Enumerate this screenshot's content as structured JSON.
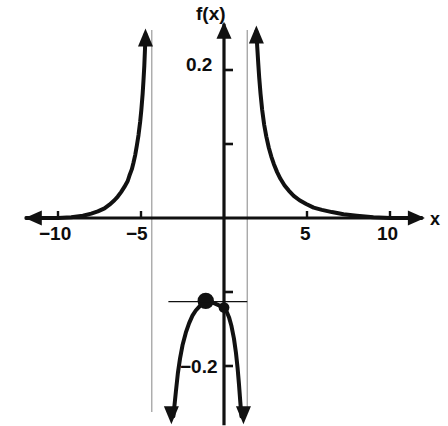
{
  "figure": {
    "kind": "function-graph",
    "background_color": "#ffffff",
    "ink_color": "#111111",
    "asymptote_color": "#9a9a9a",
    "width": 448,
    "height": 426
  },
  "labels": {
    "y_axis_label": "f(x)",
    "x_axis_label": "x"
  },
  "axis_ticks": {
    "x_labeled": [
      "−10",
      "−5",
      "5",
      "10"
    ],
    "y_labeled": [
      "0.2",
      "−0.2"
    ],
    "y_unlabeled_count": 2
  },
  "chart_data": {
    "type": "line",
    "title": "",
    "xlabel": "x",
    "ylabel": "f(x)",
    "xlim": [
      -12.0,
      12.1
    ],
    "ylim": [
      -0.28,
      0.276
    ],
    "grid": false,
    "legend": false,
    "legend_position": "none",
    "x_ticks": [
      -10,
      -5,
      0,
      5,
      10
    ],
    "x_tick_labels": [
      "−10",
      "−5",
      "",
      "5",
      "10"
    ],
    "y_ticks": [
      -0.2,
      -0.1,
      0.1,
      0.2
    ],
    "y_tick_labels": [
      "−0.2",
      "",
      "",
      "0.2"
    ],
    "axis_arrows": [
      "x-left",
      "x-right",
      "y-up"
    ],
    "vertical_asymptotes": [
      -4.35,
      1.4
    ],
    "annotations": [
      {
        "name": "local-maximum-dot",
        "x": -1.1,
        "y": -0.112,
        "marker": "filled-circle",
        "size": "large"
      },
      {
        "name": "y-intercept-dot",
        "x": 0.0,
        "y": -0.121,
        "marker": "filled-circle",
        "size": "small"
      },
      {
        "name": "horizontal-reference-line",
        "y": -0.113,
        "x_start": -3.35,
        "x_end": 1.4
      }
    ],
    "series": [
      {
        "name": "left-branch",
        "comment": "decays to 0 as x decreases; rises to +infinity approaching the asymptote near x=-4.35 from the left",
        "points": [
          [
            -11.9,
            0.0
          ],
          [
            -10.0,
            0.0
          ],
          [
            -9.2,
            0.001
          ],
          [
            -8.5,
            0.003
          ],
          [
            -8.0,
            0.006
          ],
          [
            -7.6,
            0.009
          ],
          [
            -7.2,
            0.013
          ],
          [
            -6.9,
            0.018
          ],
          [
            -6.6,
            0.024
          ],
          [
            -6.4,
            0.029
          ],
          [
            -6.2,
            0.035
          ],
          [
            -6.0,
            0.042
          ],
          [
            -5.8,
            0.05
          ],
          [
            -5.7,
            0.057
          ],
          [
            -5.55,
            0.066
          ],
          [
            -5.45,
            0.075
          ],
          [
            -5.35,
            0.085
          ],
          [
            -5.25,
            0.098
          ],
          [
            -5.15,
            0.112
          ],
          [
            -5.05,
            0.13
          ],
          [
            -4.98,
            0.146
          ],
          [
            -4.9,
            0.168
          ],
          [
            -4.85,
            0.186
          ],
          [
            -4.8,
            0.206
          ],
          [
            -4.76,
            0.228
          ],
          [
            -4.73,
            0.248
          ]
        ]
      },
      {
        "name": "middle-branch",
        "comment": "inverted U between the two asymptotes; plunges to -infinity at both ends",
        "points": [
          [
            -3.05,
            -0.268
          ],
          [
            -2.9,
            -0.235
          ],
          [
            -2.78,
            -0.21
          ],
          [
            -2.65,
            -0.19
          ],
          [
            -2.5,
            -0.172
          ],
          [
            -2.3,
            -0.155
          ],
          [
            -2.1,
            -0.142
          ],
          [
            -1.9,
            -0.132
          ],
          [
            -1.7,
            -0.125
          ],
          [
            -1.5,
            -0.12
          ],
          [
            -1.3,
            -0.115
          ],
          [
            -1.1,
            -0.112
          ],
          [
            -0.9,
            -0.112
          ],
          [
            -0.7,
            -0.114
          ],
          [
            -0.5,
            -0.116
          ],
          [
            -0.3,
            -0.118
          ],
          [
            -0.1,
            -0.12
          ],
          [
            0.0,
            -0.121
          ],
          [
            0.15,
            -0.126
          ],
          [
            0.3,
            -0.134
          ],
          [
            0.45,
            -0.146
          ],
          [
            0.6,
            -0.163
          ],
          [
            0.72,
            -0.182
          ],
          [
            0.82,
            -0.203
          ],
          [
            0.9,
            -0.224
          ],
          [
            0.98,
            -0.248
          ],
          [
            1.05,
            -0.268
          ]
        ]
      },
      {
        "name": "right-branch",
        "comment": "rises to +infinity approaching the asymptote near x=1.4 from the right; decays to 0 as x increases",
        "points": [
          [
            1.95,
            0.252
          ],
          [
            2.0,
            0.232
          ],
          [
            2.06,
            0.21
          ],
          [
            2.12,
            0.19
          ],
          [
            2.2,
            0.168
          ],
          [
            2.3,
            0.146
          ],
          [
            2.42,
            0.126
          ],
          [
            2.55,
            0.11
          ],
          [
            2.7,
            0.095
          ],
          [
            2.85,
            0.083
          ],
          [
            3.0,
            0.073
          ],
          [
            3.2,
            0.062
          ],
          [
            3.4,
            0.053
          ],
          [
            3.65,
            0.044
          ],
          [
            3.9,
            0.037
          ],
          [
            4.2,
            0.03
          ],
          [
            4.55,
            0.024
          ],
          [
            4.95,
            0.019
          ],
          [
            5.4,
            0.014
          ],
          [
            5.9,
            0.011
          ],
          [
            6.5,
            0.008
          ],
          [
            7.2,
            0.005
          ],
          [
            8.0,
            0.003
          ],
          [
            9.0,
            0.001
          ],
          [
            10.0,
            0.0
          ],
          [
            11.9,
            0.0
          ]
        ]
      }
    ]
  }
}
